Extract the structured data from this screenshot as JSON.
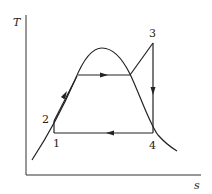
{
  "diagram": {
    "type": "T-s diagram (Rankine cycle with superheat)",
    "axes": {
      "y_label": "T",
      "x_label": "s"
    },
    "points": [
      {
        "id": "1",
        "label": "1"
      },
      {
        "id": "2",
        "label": "2"
      },
      {
        "id": "3",
        "label": "3"
      },
      {
        "id": "4",
        "label": "4"
      }
    ],
    "processes": [
      {
        "from": "1",
        "to": "2",
        "description": "pump compression (vertical)"
      },
      {
        "from": "2",
        "to": "sat-liquid",
        "description": "heating along liquid line",
        "arrow": "up-right"
      },
      {
        "from": "sat-liquid",
        "to": "sat-vapor",
        "description": "evaporation (horizontal)",
        "arrow": "right"
      },
      {
        "from": "sat-vapor",
        "to": "3",
        "description": "superheating"
      },
      {
        "from": "3",
        "to": "4",
        "description": "isentropic expansion (vertical)",
        "arrow": "down"
      },
      {
        "from": "4",
        "to": "1",
        "description": "condensation (horizontal)",
        "arrow": "left"
      }
    ],
    "saturation_dome": "bell-shaped curve"
  }
}
